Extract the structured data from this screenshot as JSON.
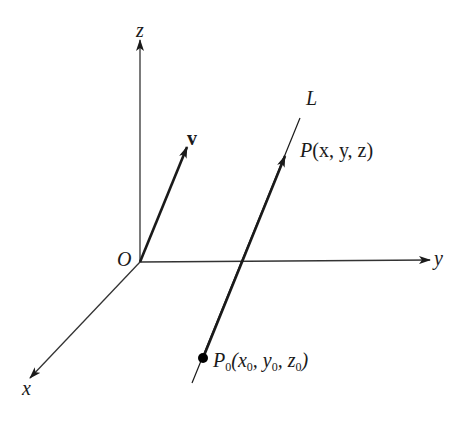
{
  "diagram": {
    "axes": {
      "x_label": "x",
      "y_label": "y",
      "z_label": "z",
      "origin_label": "O"
    },
    "vector_label": "v",
    "line_label": "L",
    "point_P": {
      "name": "P",
      "coords": "(x, y, z)"
    },
    "point_P0": {
      "name": "P",
      "sub": "0",
      "open": "(x",
      "x_sub": "0",
      "sep1": ", y",
      "y_sub": "0",
      "sep2": ", z",
      "z_sub": "0",
      "close": ")"
    },
    "colors": {
      "stroke": "#1a1a1a",
      "axis": "#333333",
      "background": "#ffffff"
    }
  }
}
